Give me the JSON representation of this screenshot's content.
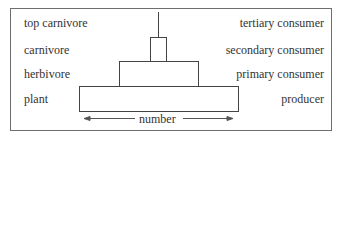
{
  "diagram": {
    "levels": [
      {
        "organism": "top carnivore",
        "role": "tertiary consumer",
        "relative_number": 0
      },
      {
        "organism": "carnivore",
        "role": "secondary consumer",
        "relative_number": 0.1
      },
      {
        "organism": "herbivore",
        "role": "primary consumer",
        "relative_number": 0.5
      },
      {
        "organism": "plant",
        "role": "producer",
        "relative_number": 1.0
      }
    ],
    "axis_label": "number",
    "colors": {
      "line": "#444444",
      "frame": "#6e6e6e",
      "text": "#333333"
    }
  }
}
